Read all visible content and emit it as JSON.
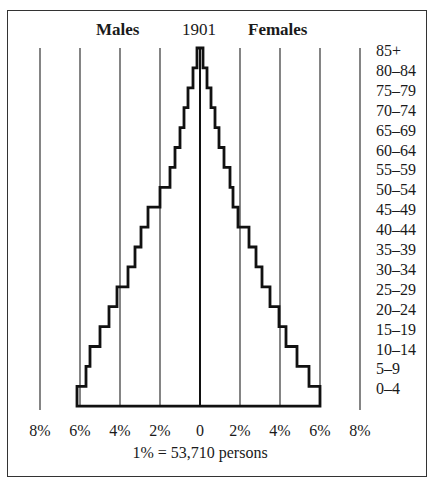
{
  "chart_data": {
    "type": "bar",
    "subtype": "population-pyramid",
    "title": "1901",
    "left_label": "Males",
    "right_label": "Females",
    "categories": [
      "85+",
      "80–84",
      "75–79",
      "70–74",
      "65–69",
      "60–64",
      "55–59",
      "50–54",
      "45–49",
      "40–44",
      "35–39",
      "30–34",
      "25–29",
      "20–24",
      "15–19",
      "10–14",
      "5–9",
      "0–4"
    ],
    "series": [
      {
        "name": "Males",
        "values": [
          0.15,
          0.35,
          0.6,
          0.8,
          1.0,
          1.25,
          1.5,
          2.0,
          2.6,
          2.95,
          3.25,
          3.6,
          4.15,
          4.55,
          5.0,
          5.5,
          5.7,
          6.15
        ]
      },
      {
        "name": "Females",
        "values": [
          0.15,
          0.35,
          0.55,
          0.75,
          0.95,
          1.2,
          1.5,
          1.65,
          1.9,
          2.45,
          2.8,
          3.1,
          3.5,
          3.95,
          4.3,
          4.85,
          5.45,
          6.0
        ]
      }
    ],
    "x_ticks": [
      "8%",
      "6%",
      "4%",
      "2%",
      "0",
      "2%",
      "4%",
      "6%",
      "8%"
    ],
    "xlim": [
      -8,
      8
    ],
    "xlabel": "1% = 53,710 persons",
    "grid": true,
    "unit": "percent of total population"
  },
  "header": {
    "males": "Males",
    "year": "1901",
    "females": "Females"
  },
  "footer": {
    "scale_note": "1% = 53,710 persons"
  }
}
